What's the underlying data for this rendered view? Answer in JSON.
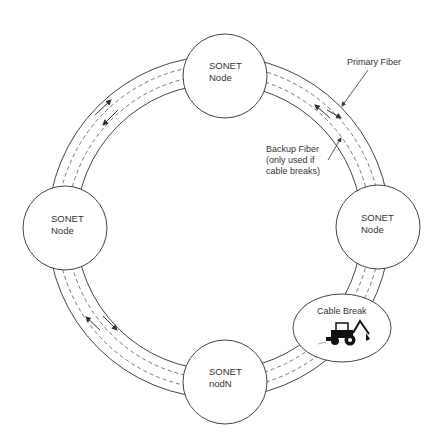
{
  "diagram": {
    "ring": {
      "center": [
        219,
        227
      ],
      "outer_radius": 171,
      "inner_radius": 143,
      "primary_fiber_radius": 163,
      "backup_fiber_radius": 153
    },
    "nodes": [
      {
        "id": "top",
        "line1": "SONET",
        "line2": "Node",
        "cx": 225,
        "cy": 76,
        "r": 42
      },
      {
        "id": "left",
        "line1": "SONET",
        "line2": "Node",
        "cx": 65,
        "cy": 228,
        "r": 42
      },
      {
        "id": "right",
        "line1": "SONET",
        "line2": "Node",
        "cx": 378,
        "cy": 227,
        "r": 42
      },
      {
        "id": "bottom",
        "line1": "SONET",
        "line2": "nodN",
        "cx": 225,
        "cy": 382,
        "r": 42
      }
    ],
    "labels": {
      "primary_fiber": "Primary Fiber",
      "backup_fiber_line1": "Backup Fiber",
      "backup_fiber_line2": "(only used if",
      "backup_fiber_line3": "cable breaks)",
      "cable_break": "Cable Break"
    },
    "icons": {
      "cable_break_icon": "backhoe-icon"
    },
    "colors": {
      "stroke": "#333333",
      "background": "#ffffff"
    }
  }
}
